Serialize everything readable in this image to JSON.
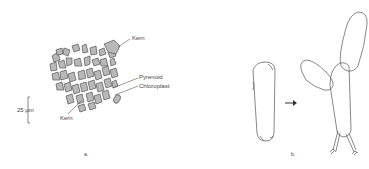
{
  "panel_a": {
    "caption": "a.",
    "labels": {
      "kern_top": "Kern",
      "pyrenoid": "Pyrenoid",
      "chloroplast": "Chloroplast",
      "kern_bottom": "Kern"
    },
    "scale_bar": "25 μm"
  },
  "panel_b": {
    "caption": "b.",
    "arrow": "→"
  },
  "colors": {
    "outline": "#555555",
    "fill": "#b8b8b8",
    "background": "#ffffff"
  }
}
